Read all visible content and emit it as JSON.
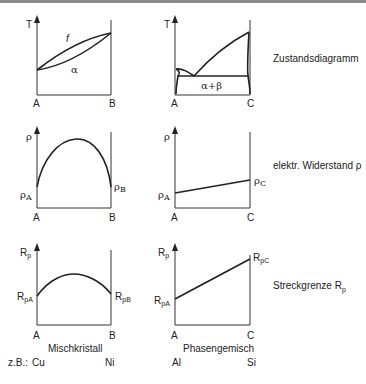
{
  "rows": [
    {
      "property_label": "Zustandsdiagramm",
      "left": {
        "y_axis": "T",
        "x_left": "A",
        "x_right": "B",
        "region_upper": "f",
        "region_lower": "α"
      },
      "right": {
        "y_axis": "T",
        "x_left": "A",
        "x_right": "C",
        "region": "α+β"
      }
    },
    {
      "property_label": "elektr. Widerstand ρ",
      "left": {
        "y_axis": "ρ",
        "x_left": "A",
        "x_right": "B",
        "start_value": "ρA",
        "end_value": "ρB"
      },
      "right": {
        "y_axis": "ρ",
        "x_left": "A",
        "x_right": "C",
        "start_value": "ρA",
        "end_value": "ρC"
      }
    },
    {
      "property_label": "Streckgrenze Rp",
      "left": {
        "y_axis": "Rp",
        "x_left": "A",
        "x_right": "B",
        "start_value": "RpA",
        "end_value": "RpB"
      },
      "right": {
        "y_axis": "Rp",
        "x_left": "A",
        "x_right": "C",
        "start_value": "RpA",
        "end_value": "RpC"
      }
    }
  ],
  "columns": {
    "left_title": "Mischkristall",
    "right_title": "Phasengemisch"
  },
  "examples": {
    "prefix": "z.B.:",
    "left_a": "Cu",
    "left_b": "Ni",
    "right_a": "Al",
    "right_c": "Si"
  },
  "labels": {
    "T": "T",
    "rho": "ρ",
    "R": "R",
    "p": "p",
    "A": "A",
    "B": "B",
    "C": "C",
    "pA": "pA",
    "pB": "pB",
    "pC": "pC",
    "rhoA_sub": "A",
    "rhoB_sub": "B",
    "rhoC_sub": "C",
    "f": "f",
    "alpha": "α",
    "alpha_beta": "α+β",
    "streck": "Streckgrenze R",
    "streck_sub": "p"
  }
}
